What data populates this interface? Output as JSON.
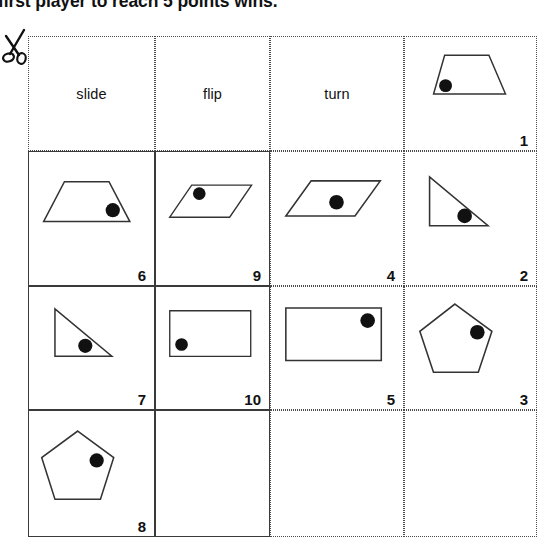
{
  "page": {
    "top_instruction": "first player to reach 5 points wins.",
    "cut_icon": "scissors-icon",
    "background_color": "#ffffff",
    "line_color": "#333333",
    "dot_color": "#111111"
  },
  "grid": {
    "columns": 4,
    "rows": 4,
    "column_x": [
      0,
      127,
      242,
      376,
      509
    ],
    "row_y": [
      0,
      115,
      250,
      374,
      501
    ]
  },
  "headers": [
    {
      "label": "slide",
      "col": 0
    },
    {
      "label": "flip",
      "col": 1
    },
    {
      "label": "turn",
      "col": 2
    }
  ],
  "cards": [
    {
      "number": "1",
      "shape": "trapezoid",
      "dot_position": "lower-left",
      "col": 3,
      "row": 0,
      "bordered": false,
      "points": "18,52 30,10 78,10 96,52",
      "dot": {
        "cx": 31,
        "cy": 43,
        "r": 7
      }
    },
    {
      "number": "6",
      "shape": "trapezoid",
      "dot_position": "lower-right",
      "col": 0,
      "row": 1,
      "bordered": true,
      "points": "8,54 30,12 77,12 99,54",
      "dot": {
        "cx": 81,
        "cy": 42,
        "r": 7.5
      }
    },
    {
      "number": "9",
      "shape": "parallelogram",
      "dot_position": "upper-left",
      "col": 1,
      "row": 1,
      "bordered": true,
      "points": "8,50 34,12 105,12 79,50",
      "dot": {
        "cx": 43,
        "cy": 22,
        "r": 7.5
      }
    },
    {
      "number": "4",
      "shape": "parallelogram",
      "dot_position": "center-right",
      "col": 2,
      "row": 1,
      "bordered": false,
      "points": "6,48 32,12 103,12 77,48",
      "dot": {
        "cx": 58,
        "cy": 34,
        "r": 7.5
      }
    },
    {
      "number": "2",
      "shape": "right-triangle",
      "dot_position": "lower-right",
      "col": 3,
      "row": 1,
      "bordered": false,
      "points": "16,8 16,58 76,58",
      "dot": {
        "cx": 52,
        "cy": 48,
        "r": 7.5
      }
    },
    {
      "number": "7",
      "shape": "right-triangle",
      "dot_position": "lower-right",
      "col": 0,
      "row": 2,
      "bordered": true,
      "points": "20,10 20,60 80,60",
      "dot": {
        "cx": 52,
        "cy": 49,
        "r": 7.5
      }
    },
    {
      "number": "10",
      "shape": "rectangle",
      "dot_position": "left-lower",
      "col": 1,
      "row": 2,
      "bordered": true,
      "points": "8,8 104,8 104,62 8,62",
      "dot": {
        "cx": 22,
        "cy": 48,
        "r": 7.5
      }
    },
    {
      "number": "5",
      "shape": "rectangle",
      "dot_position": "upper-right",
      "col": 2,
      "row": 2,
      "bordered": false,
      "points": "6,10 104,10 104,64 6,64",
      "dot": {
        "cx": 90,
        "cy": 23,
        "r": 7.5
      }
    },
    {
      "number": "3",
      "shape": "pentagon",
      "dot_position": "upper-right",
      "col": 3,
      "row": 2,
      "bordered": false,
      "points": "42,6 80,34 66,76 20,76 6,34",
      "dot": {
        "cx": 65,
        "cy": 35,
        "r": 7.5
      }
    },
    {
      "number": "8",
      "shape": "pentagon",
      "dot_position": "upper-right",
      "col": 0,
      "row": 3,
      "bordered": true,
      "points": "44,6 82,34 68,78 20,78 6,34",
      "dot": {
        "cx": 64,
        "cy": 37,
        "r": 7.5
      }
    }
  ],
  "empty_cells": [
    {
      "col": 1,
      "row": 3,
      "bordered": true
    },
    {
      "col": 2,
      "row": 3,
      "bordered": false
    },
    {
      "col": 3,
      "row": 3,
      "bordered": false
    }
  ],
  "header_empty_cell": {
    "col": 3,
    "row": 0
  }
}
